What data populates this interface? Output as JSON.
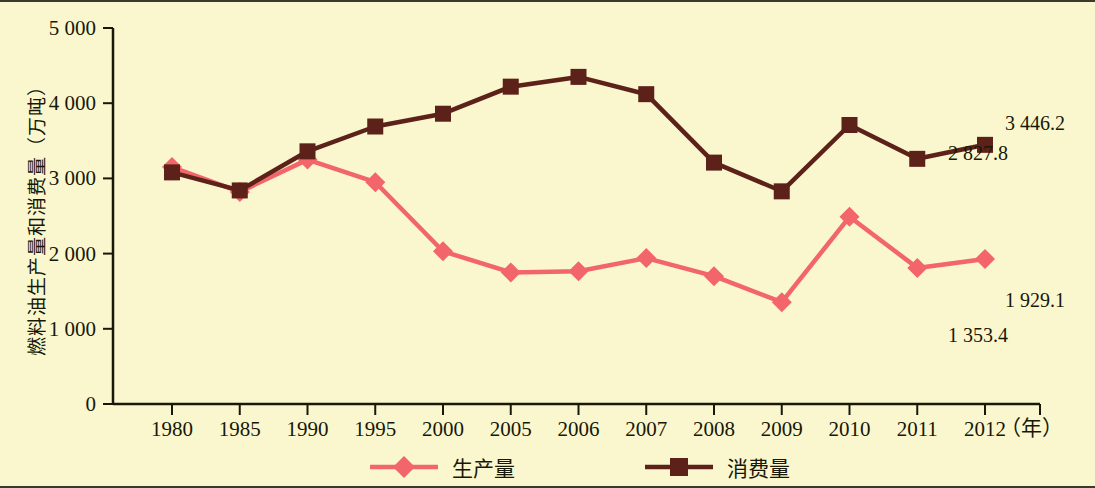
{
  "chart_data": {
    "type": "line",
    "title": "",
    "xlabel": "年",
    "ylabel": "燃料油生产量和消费量（万吨）",
    "ylim": [
      0,
      5000
    ],
    "ytick_labels": [
      "0",
      "1 000",
      "2 000",
      "3 000",
      "4 000",
      "5 000"
    ],
    "ytick_values": [
      0,
      1000,
      2000,
      3000,
      4000,
      5000
    ],
    "grid": false,
    "legend_position": "bottom",
    "categories": [
      "1980",
      "1985",
      "1990",
      "1995",
      "2000",
      "2005",
      "2006",
      "2007",
      "2008",
      "2009",
      "2010",
      "2011",
      "2012"
    ],
    "series": [
      {
        "name": "生产量",
        "color": "#f2656a",
        "marker": "diamond",
        "values": [
          3150,
          2820,
          3250,
          2950,
          2030,
          1750,
          1765,
          1940,
          1700,
          1353.4,
          2490,
          1810,
          1929.1
        ]
      },
      {
        "name": "消费量",
        "color": "#5c2118",
        "marker": "square",
        "values": [
          3080,
          2840,
          3360,
          3690,
          3860,
          4220,
          4350,
          4120,
          3210,
          2827.8,
          3710,
          3260,
          3446.2
        ]
      }
    ],
    "annotations": [
      {
        "id": "consumption-2009",
        "label": "2 827.8",
        "x_pct": 73.6,
        "y_px": 158
      },
      {
        "id": "consumption-2012",
        "label": "3 446.2",
        "x_pct": 94.0,
        "y_px": 128
      },
      {
        "id": "production-2009",
        "label": "1 353.4",
        "x_pct": 73.6,
        "y_px": 340
      },
      {
        "id": "production-2012",
        "label": "1 929.1",
        "x_pct": 94.0,
        "y_px": 305
      }
    ]
  },
  "legend": {
    "items": [
      {
        "label": "生产量",
        "color": "#f2656a",
        "marker": "diamond"
      },
      {
        "label": "消费量",
        "color": "#5c2118",
        "marker": "square"
      }
    ]
  },
  "axes": {
    "y_label": "燃料油生产量和消费量（万吨）",
    "x_unit": "（年）"
  }
}
